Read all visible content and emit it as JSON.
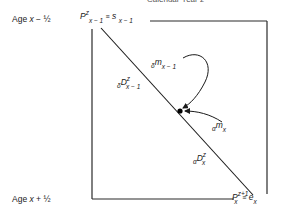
{
  "diagram": {
    "title": "Calendar Year z",
    "row_labels": {
      "top": {
        "prefix": "Age ",
        "var": "x",
        "op": " − ",
        "frac": "½"
      },
      "bottom": {
        "prefix": "Age ",
        "var": "x",
        "op": " + ",
        "frac": "½"
      }
    },
    "top_corner": {
      "P": "P",
      "P_sup": "z",
      "P_sub": "x − 1",
      "equiv": "≡",
      "s": "s",
      "s_sub": "x − 1"
    },
    "bottom_corner": {
      "P": "P",
      "P_sup": "z+1",
      "P_sub": "x",
      "equiv": "≡",
      "e": "e",
      "e_sub": "x"
    },
    "flows": {
      "delta_m": {
        "pre": "δ",
        "main": "m",
        "sub": "x − 1"
      },
      "delta_D": {
        "pre": "δ",
        "main": "D",
        "sup": "z",
        "sub": "x − 1"
      },
      "alpha_m": {
        "pre": "α",
        "main": "m",
        "sub": "x"
      },
      "alpha_D": {
        "pre": "α",
        "main": "D",
        "sup": "z",
        "sub": "x"
      }
    },
    "colors": {
      "line": "#1a1a1a",
      "background": "#ffffff"
    }
  }
}
